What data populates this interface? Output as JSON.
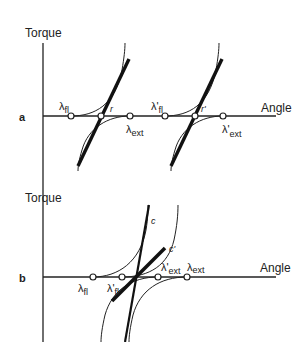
{
  "figure": {
    "panel_a": {
      "letter": "a",
      "y_label": "Torque",
      "x_label": "Angle",
      "points": [
        {
          "name": "lambda-fl",
          "label": "λ",
          "sub": "fl"
        },
        {
          "name": "r",
          "label": "r"
        },
        {
          "name": "lambda-ext",
          "label": "λ",
          "sub": "ext"
        },
        {
          "name": "lambda-fl-prime",
          "label": "λ'",
          "sub": "fl"
        },
        {
          "name": "r-prime",
          "label": "r'"
        },
        {
          "name": "lambda-ext-prime",
          "label": "λ'",
          "sub": "ext"
        }
      ]
    },
    "panel_b": {
      "letter": "b",
      "y_label": "Torque",
      "x_label": "Angle",
      "curve_labels": {
        "c": "c",
        "c_prime": "c'"
      },
      "points": [
        {
          "name": "lambda-fl",
          "label": "λ",
          "sub": "fl"
        },
        {
          "name": "lambda-fl-prime",
          "label": "λ'",
          "sub": "fl"
        },
        {
          "name": "lambda-ext-prime",
          "label": "λ'",
          "sub": "ext"
        },
        {
          "name": "lambda-ext",
          "label": "λ",
          "sub": "ext"
        }
      ]
    }
  }
}
